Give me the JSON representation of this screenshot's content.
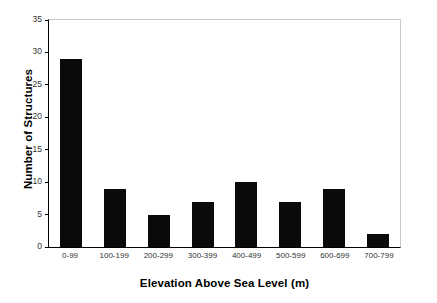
{
  "chart_data": {
    "type": "bar",
    "title": "",
    "xlabel": "Elevation Above Sea Level (m)",
    "ylabel": "Number of Structures",
    "categories": [
      "0-99",
      "100-199",
      "200-299",
      "300-399",
      "400-499",
      "500-599",
      "600-699",
      "700-799"
    ],
    "values": [
      29,
      9,
      5,
      7,
      10,
      7,
      9,
      2
    ],
    "ylim": [
      0,
      35
    ],
    "yticks": [
      0,
      5,
      10,
      15,
      20,
      25,
      30,
      35
    ],
    "ytick_labels": [
      "0",
      "5",
      "10",
      "15",
      "20",
      "25",
      "30",
      "35"
    ],
    "grid": false,
    "legend": null,
    "bar_color": "#0a0a0a",
    "axis_color": "#000000",
    "plot_border_color": "#c9c9c9",
    "background_color": "#ffffff"
  }
}
